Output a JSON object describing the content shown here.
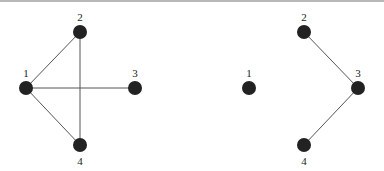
{
  "graphs": [
    {
      "name": "left-graph",
      "nodes": [
        {
          "id": "1",
          "label": "1"
        },
        {
          "id": "2",
          "label": "2"
        },
        {
          "id": "3",
          "label": "3"
        },
        {
          "id": "4",
          "label": "4"
        }
      ],
      "edges": [
        [
          "1",
          "2"
        ],
        [
          "1",
          "3"
        ],
        [
          "1",
          "4"
        ],
        [
          "2",
          "4"
        ]
      ]
    },
    {
      "name": "right-graph",
      "nodes": [
        {
          "id": "1",
          "label": "1"
        },
        {
          "id": "2",
          "label": "2"
        },
        {
          "id": "3",
          "label": "3"
        },
        {
          "id": "4",
          "label": "4"
        }
      ],
      "edges": [
        [
          "2",
          "3"
        ],
        [
          "3",
          "4"
        ]
      ]
    }
  ],
  "colors": {
    "node": "#222222",
    "edge": "#555555"
  }
}
